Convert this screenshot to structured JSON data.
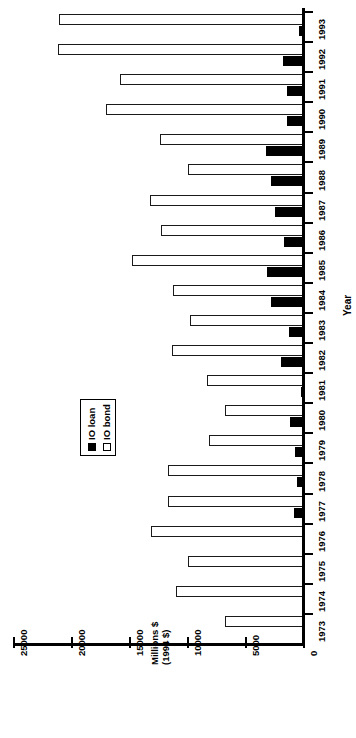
{
  "chart_data": {
    "type": "bar",
    "orientation": "horizontal",
    "title": "",
    "xlabel": "Millions $ (1994 $)",
    "xlabel_lines": [
      "Millions $",
      "(1994 $)"
    ],
    "ylabel": "Year",
    "categories": [
      "1973",
      "1974",
      "1975",
      "1976",
      "1977",
      "1978",
      "1979",
      "1980",
      "1981",
      "1982",
      "1983",
      "1984",
      "1985",
      "1986",
      "1987",
      "1988",
      "1989",
      "1990",
      "1991",
      "1992",
      "1993"
    ],
    "series": [
      {
        "name": "IO loan",
        "color": "#000000",
        "values": [
          0,
          0,
          0,
          60,
          780,
          520,
          690,
          1120,
          170,
          1900,
          1210,
          2760,
          3100,
          1640,
          2410,
          2760,
          3190,
          1380,
          1380,
          1720,
          350
        ]
      },
      {
        "name": "IO bond",
        "color": "#ffffff",
        "values": [
          6730,
          10950,
          9900,
          13100,
          11640,
          11640,
          8110,
          6730,
          8280,
          11290,
          9740,
          11210,
          14750,
          12240,
          13190,
          9910,
          12330,
          16980,
          15780,
          21120,
          21030
        ]
      }
    ],
    "xlim": [
      0,
      25000
    ],
    "xticks": [
      0,
      5000,
      10000,
      15000,
      20000,
      25000
    ],
    "xtick_labels": [
      "0",
      "5000",
      "10000",
      "15000",
      "20000",
      "25000"
    ],
    "grid": false,
    "legend": {
      "position": "center-left",
      "entries": [
        {
          "label": "IO loan",
          "marker": "filled-square",
          "color": "#000000"
        },
        {
          "label": "IO bond",
          "marker": "open-square",
          "color": "#ffffff"
        }
      ]
    }
  }
}
